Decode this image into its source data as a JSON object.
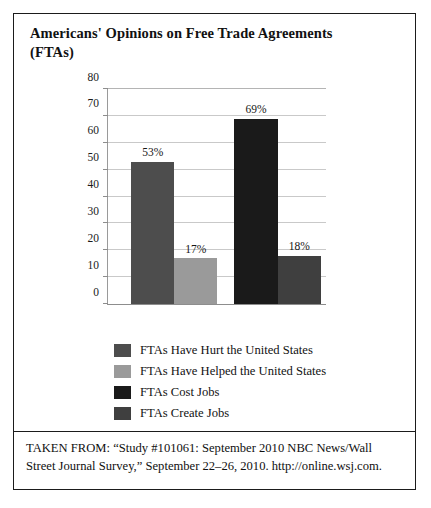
{
  "figure": {
    "title": "Americans' Opinions on Free Trade Agreements (FTAs)",
    "source_note": "TAKEN FROM: “Study #101061: September 2010 NBC News/Wall Street Journal Survey,” September 22–26, 2010. http://online.wsj.com."
  },
  "chart_data": {
    "type": "bar",
    "title": "Americans' Opinions on Free Trade Agreements (FTAs)",
    "xlabel": "",
    "ylabel": "",
    "ylim": [
      0,
      80
    ],
    "ytick_labels": [
      "0",
      "10",
      "20",
      "30",
      "40",
      "50",
      "60",
      "70",
      "80"
    ],
    "ytick_values": [
      0,
      10,
      20,
      30,
      40,
      50,
      60,
      70,
      80
    ],
    "grid": true,
    "legend_position": "below",
    "categories": [
      "FTAs Have Hurt the United States",
      "FTAs Have Helped the United States",
      "FTAs Cost Jobs",
      "FTAs Create Jobs"
    ],
    "values": [
      53,
      17,
      69,
      18
    ],
    "data_labels": [
      "53%",
      "17%",
      "69%",
      "18%"
    ],
    "colors": [
      "#4d4d4d",
      "#9a9a9a",
      "#1a1a1a",
      "#3f3f3f"
    ],
    "bars": [
      {
        "label": "FTAs Have Hurt the United States",
        "value": 53,
        "data_label": "53%",
        "color": "#4d4d4d",
        "left_pct": 10.6,
        "width_pct": 19.8
      },
      {
        "label": "FTAs Have Helped the United States",
        "value": 17,
        "data_label": "17%",
        "color": "#9a9a9a",
        "left_pct": 30.4,
        "width_pct": 19.8
      },
      {
        "label": "FTAs Cost Jobs",
        "value": 69,
        "data_label": "69%",
        "color": "#1a1a1a",
        "left_pct": 58.0,
        "width_pct": 19.8
      },
      {
        "label": "FTAs Create Jobs",
        "value": 18,
        "data_label": "18%",
        "color": "#3f3f3f",
        "left_pct": 77.8,
        "width_pct": 19.8
      }
    ]
  },
  "legend": {
    "items": [
      {
        "label": "FTAs Have Hurt the United States",
        "color": "#4d4d4d"
      },
      {
        "label": "FTAs Have Helped the United States",
        "color": "#9a9a9a"
      },
      {
        "label": "FTAs Cost Jobs",
        "color": "#1a1a1a"
      },
      {
        "label": "FTAs Create Jobs",
        "color": "#3f3f3f"
      }
    ]
  }
}
